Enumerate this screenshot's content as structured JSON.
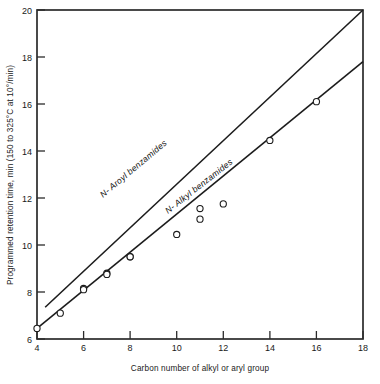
{
  "chart_data": {
    "type": "line",
    "title": "",
    "xlabel": "Carbon number of alkyl or aryl group",
    "ylabel": "Programmed retention time, min (150 to 325°C at 10°/min)",
    "xlim": [
      4,
      18
    ],
    "ylim": [
      6,
      20
    ],
    "xticks": [
      4,
      6,
      8,
      10,
      12,
      14,
      16,
      18
    ],
    "xtick_labels": [
      "4",
      "6",
      "8",
      "10",
      "12",
      "14",
      "16",
      "18"
    ],
    "yticks": [
      6,
      8,
      10,
      12,
      14,
      16,
      18,
      20
    ],
    "ytick_labels": [
      "6",
      "8",
      "10",
      "12",
      "14",
      "16",
      "18",
      "20"
    ],
    "grid": false,
    "legend": "inline-labels",
    "marker": "open-circle",
    "series": [
      {
        "name": "N-Aroyl benzamides",
        "label": "N- Aroyl benzamides",
        "color": "#1c1c1c",
        "x": [
          4.35,
          6,
          7,
          8,
          11,
          18
        ],
        "y": [
          7.35,
          8.15,
          8.8,
          9.5,
          11.55,
          20.0
        ],
        "marker_x": [
          6,
          7,
          8,
          11
        ],
        "marker_y": [
          8.15,
          8.8,
          9.5,
          11.55
        ],
        "line_from": [
          4.35,
          7.35
        ],
        "line_to": [
          18,
          20.0
        ]
      },
      {
        "name": "N-Alkyl benzamides",
        "label": "N- Alkyl benzamides",
        "color": "#1c1c1c",
        "x": [
          4,
          5,
          6,
          7,
          8,
          10,
          11,
          12,
          14,
          16,
          18
        ],
        "y": [
          6.45,
          7.1,
          8.1,
          8.75,
          9.5,
          10.45,
          11.1,
          11.75,
          14.45,
          16.1,
          17.8
        ],
        "marker_x": [
          4,
          5,
          6,
          7,
          8,
          10,
          11,
          12,
          14,
          16
        ],
        "marker_y": [
          6.45,
          7.1,
          8.1,
          8.75,
          9.5,
          10.45,
          11.1,
          11.75,
          14.45,
          16.1
        ],
        "line_from": [
          4,
          6.45
        ],
        "line_to": [
          18,
          17.8
        ]
      }
    ],
    "annotations": [
      {
        "text": "N- Aroyl benzamides",
        "series": "N-Aroyl benzamides"
      },
      {
        "text": "N- Alkyl benzamides",
        "series": "N-Alkyl benzamides"
      }
    ]
  }
}
